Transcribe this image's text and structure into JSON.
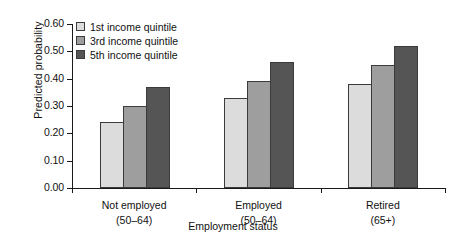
{
  "chart_data": {
    "type": "bar",
    "title": "",
    "xlabel": "Employment status",
    "ylabel": "Predicted probability",
    "categories": [
      "Not employed\n(50–64)",
      "Employed\n(50–64)",
      "Retired\n(65+)"
    ],
    "category_labels": [
      {
        "main": "Not employed",
        "sub": "(50–64)"
      },
      {
        "main": "Employed",
        "sub": "(50–64)"
      },
      {
        "main": "Retired",
        "sub": "(65+)"
      }
    ],
    "series": [
      {
        "name": "1st income quintile",
        "color": "#dcdcdc",
        "values": [
          0.24,
          0.33,
          0.38
        ]
      },
      {
        "name": "3rd income quintile",
        "color": "#9e9e9e",
        "values": [
          0.3,
          0.39,
          0.45
        ]
      },
      {
        "name": "5th income quintile",
        "color": "#555555",
        "values": [
          0.37,
          0.46,
          0.52
        ]
      }
    ],
    "ylim": [
      0.0,
      0.6
    ],
    "ytick_labels": [
      "0.60",
      "0.50",
      "0.40",
      "0.30",
      "0.20",
      "0.10",
      "0.00"
    ],
    "ytick_values": [
      0.6,
      0.5,
      0.4,
      0.3,
      0.2,
      0.1,
      0.0
    ],
    "grid": false,
    "legend_position": "top-left",
    "legend": [
      {
        "label": "1st income quintile",
        "color": "#dcdcdc"
      },
      {
        "label": "3rd income quintile",
        "color": "#9e9e9e"
      },
      {
        "label": "5th income quintile",
        "color": "#555555"
      }
    ]
  }
}
